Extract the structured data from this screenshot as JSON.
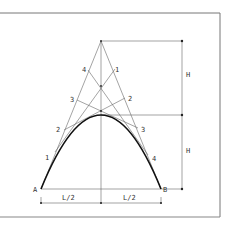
{
  "diagram": {
    "points": {
      "A": "A",
      "B": "B"
    },
    "division_labels_left": [
      "1",
      "2",
      "3",
      "4"
    ],
    "division_labels_right": [
      "1",
      "2",
      "3",
      "4"
    ],
    "dimensions": {
      "height_upper": "H",
      "height_lower": "H",
      "half_span_left": "L/2",
      "half_span_right": "L/2"
    },
    "colors": {
      "line": "#555555",
      "curve": "#111111",
      "frame": "#777777",
      "background": "#ffffff"
    }
  }
}
